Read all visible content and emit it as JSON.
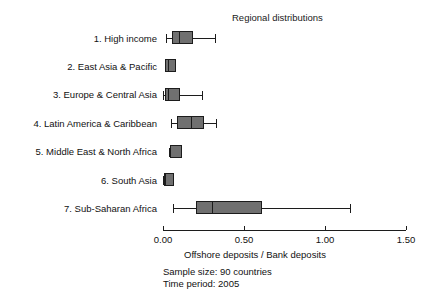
{
  "chart_data": {
    "type": "box",
    "title": "Regional distributions",
    "xlabel": "Offshore deposits / Bank deposits",
    "ylabel": "",
    "xlim": [
      0.0,
      1.5
    ],
    "grid": false,
    "legend": null,
    "xticks": [
      0.0,
      0.5,
      1.0,
      1.5
    ],
    "xticklabels": [
      "0.00",
      "0.50",
      "1.00",
      "1.50"
    ],
    "categories": [
      "1. High income",
      "2. East Asia & Pacific",
      "3. Europe & Central Asia",
      "4. Latin America & Caribbean",
      "5. Middle East & North Africa",
      "6. South Asia",
      "7. Sub-Saharan Africa"
    ],
    "boxes": [
      {
        "category": "1. High income",
        "whisker_low": 0.02,
        "q1": 0.055,
        "median": 0.1,
        "q3": 0.185,
        "whisker_high": 0.32
      },
      {
        "category": "2. East Asia & Pacific",
        "whisker_low": 0.01,
        "q1": 0.01,
        "median": 0.03,
        "q3": 0.08,
        "whisker_high": 0.08
      },
      {
        "category": "3. Europe & Central Asia",
        "whisker_low": 0.0,
        "q1": 0.01,
        "median": 0.03,
        "q3": 0.105,
        "whisker_high": 0.24
      },
      {
        "category": "4. Latin America & Caribbean",
        "whisker_low": 0.05,
        "q1": 0.085,
        "median": 0.17,
        "q3": 0.255,
        "whisker_high": 0.33
      },
      {
        "category": "5. Middle East & North Africa",
        "whisker_low": 0.04,
        "q1": 0.045,
        "median": 0.045,
        "q3": 0.12,
        "whisker_high": 0.12
      },
      {
        "category": "6. South Asia",
        "whisker_low": 0.0,
        "q1": 0.005,
        "median": 0.01,
        "q3": 0.065,
        "whisker_high": 0.065
      },
      {
        "category": "7. Sub-Saharan Africa",
        "whisker_low": 0.06,
        "q1": 0.205,
        "median": 0.305,
        "q3": 0.61,
        "whisker_high": 1.155
      }
    ],
    "annotations": [
      "Sample size: 90 countries",
      "Time period: 2005"
    ],
    "colors": {
      "box_fill": "#707070",
      "line": "#1c1c1c",
      "background": "#ffffff",
      "text": "#111111"
    }
  },
  "footer": {
    "sample_size": "Sample size: 90 countries",
    "time_period": "Time period: 2005"
  }
}
